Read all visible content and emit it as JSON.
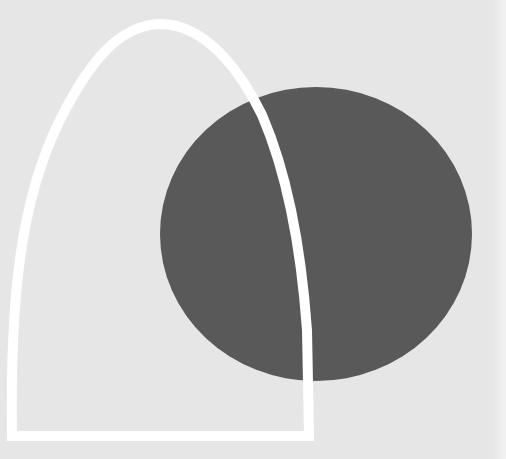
{
  "artwork": {
    "background_color": "#e6e6e6",
    "circle": {
      "color": "#595959",
      "cx": 316,
      "cy": 234,
      "rx": 156,
      "ry": 147
    },
    "arch_outline": {
      "color": "#ffffff",
      "stroke_width": 10
    }
  }
}
